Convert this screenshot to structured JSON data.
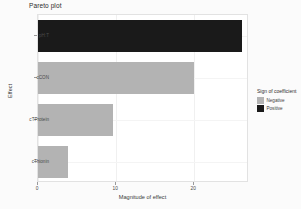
{
  "chart_data": {
    "type": "bar",
    "orientation": "horizontal",
    "title": "Pareto plot",
    "xlabel": "Magnitude of effect",
    "ylabel": "Effect",
    "categories": [
      "cThionin",
      "cTProtein",
      "cCON",
      "pH:T"
    ],
    "values": [
      3.9,
      9.6,
      20.0,
      26.1
    ],
    "signs": [
      "Negative",
      "Negative",
      "Negative",
      "Positive"
    ],
    "xlim": [
      0,
      27
    ],
    "xticks": [
      0,
      10,
      20
    ],
    "xtick_labels": [
      "0",
      "10",
      "20"
    ],
    "grid": true,
    "legend": {
      "title": "Sign of coefficient",
      "position": "right",
      "entries": [
        {
          "label": "Negative",
          "color": "#b3b3b3"
        },
        {
          "label": "Positive",
          "color": "#1a1a1a"
        }
      ]
    },
    "series": [
      {
        "name": "Magnitude of effect",
        "points": [
          {
            "category": "pH:T",
            "value": 26.1,
            "sign": "Positive",
            "color": "#1a1a1a"
          },
          {
            "category": "cCON",
            "value": 20.0,
            "sign": "Negative",
            "color": "#b3b3b3"
          },
          {
            "category": "cTProtein",
            "value": 9.6,
            "sign": "Negative",
            "color": "#b3b3b3"
          },
          {
            "category": "cThionin",
            "value": 3.9,
            "sign": "Negative",
            "color": "#b3b3b3"
          }
        ]
      }
    ]
  },
  "colors": {
    "positive": "#1a1a1a",
    "negative": "#b3b3b3",
    "panel_background": "#ffffff",
    "figure_background": "#fbfbfb",
    "gridline": "#f0f0f0",
    "axis_text": "#4a4a4a"
  }
}
